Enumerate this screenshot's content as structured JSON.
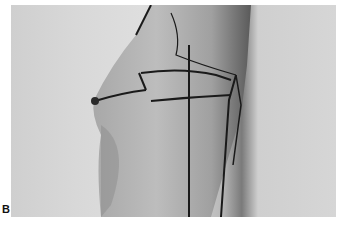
{
  "figure": {
    "panel_label": "B"
  }
}
